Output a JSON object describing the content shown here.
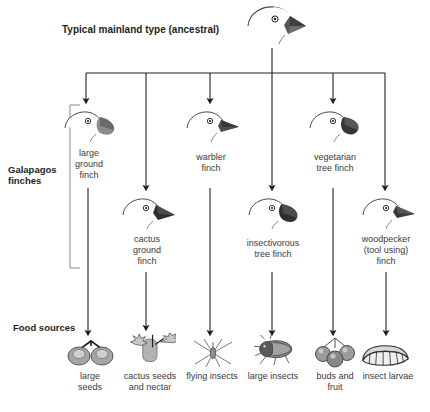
{
  "diagram": {
    "title": "Typical mainland type (ancestral)",
    "group_label_line1": "Galapagos",
    "group_label_line2": "finches",
    "food_label": "Food sources",
    "ancestor_icon": "finch-head-icon"
  },
  "finches": [
    {
      "id": "large-ground-finch",
      "line1": "large",
      "line2": "ground",
      "line3": "finch",
      "icon": "finch-head-icon"
    },
    {
      "id": "cactus-ground-finch",
      "line1": "cactus",
      "line2": "ground",
      "line3": "finch",
      "icon": "finch-head-icon"
    },
    {
      "id": "warbler-finch",
      "line1": "warbler",
      "line2": "finch",
      "line3": "",
      "icon": "finch-head-icon"
    },
    {
      "id": "insectivorous-tree-finch",
      "line1": "insectivorous",
      "line2": "tree finch",
      "line3": "",
      "icon": "finch-head-icon"
    },
    {
      "id": "vegetarian-tree-finch",
      "line1": "vegetarian",
      "line2": "tree finch",
      "line3": "",
      "icon": "finch-head-icon"
    },
    {
      "id": "woodpecker-finch",
      "line1": "woodpecker",
      "line2": "(tool using)",
      "line3": "finch",
      "icon": "finch-head-icon"
    }
  ],
  "foods": [
    {
      "id": "large-seeds",
      "line1": "large",
      "line2": "seeds",
      "icon": "seeds-icon"
    },
    {
      "id": "cactus-seeds-nectar",
      "line1": "cactus seeds",
      "line2": "and nectar",
      "icon": "cactus-flower-icon"
    },
    {
      "id": "flying-insects",
      "line1": "flying insects",
      "line2": "",
      "icon": "crane-fly-icon"
    },
    {
      "id": "large-insects",
      "line1": "large insects",
      "line2": "",
      "icon": "beetle-icon"
    },
    {
      "id": "buds-and-fruit",
      "line1": "buds and",
      "line2": "fruit",
      "icon": "berries-icon"
    },
    {
      "id": "insect-larvae",
      "line1": "insect larvae",
      "line2": "",
      "icon": "larva-icon"
    }
  ],
  "colors": {
    "line": "#231f20",
    "text": "#3a3a38",
    "heading": "#231f20",
    "beak_dark": "#3f3f42",
    "beak_mid": "#6e6e73",
    "food_fill": "#9a9a9c"
  }
}
